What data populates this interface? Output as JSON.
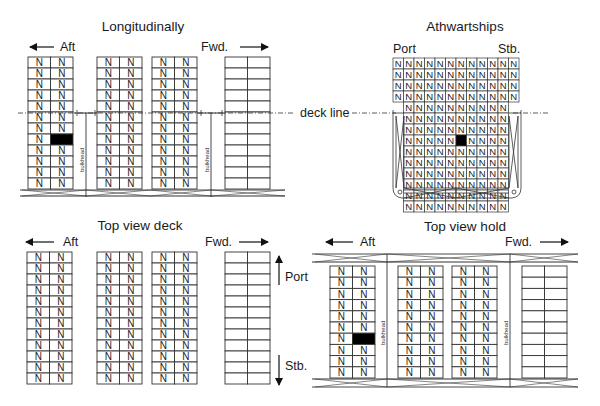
{
  "panels": {
    "longitudinal": {
      "title": "Longitudinally",
      "aft_label": "Aft",
      "fwd_label": "Fwd.",
      "deck_line_label": "deck line",
      "bulkhead_label": "bulkhead",
      "stacks": [
        {
          "rows": 12,
          "cols": 2,
          "marked": "N",
          "highlight": {
            "row": 7,
            "col": 1
          }
        },
        {
          "rows": 12,
          "cols": 2,
          "marked": "N"
        },
        {
          "rows": 12,
          "cols": 2,
          "marked": "N"
        },
        {
          "rows": 12,
          "cols": 2,
          "marked": ""
        }
      ]
    },
    "athwartships": {
      "title": "Athwartships",
      "port_label": "Port",
      "stb_label": "Stb.",
      "deck_rows": 4,
      "deck_cols": 12,
      "hold_rows": 10,
      "hold_cols": 10,
      "cell_label": "N",
      "highlight": {
        "row": 3,
        "col": 5
      }
    },
    "top_view_deck": {
      "title": "Top view deck",
      "aft_label": "Aft",
      "fwd_label": "Fwd.",
      "port_label": "Port",
      "stb_label": "Stb.",
      "stacks": [
        {
          "rows": 12,
          "cols": 2,
          "marked": "N"
        },
        {
          "rows": 12,
          "cols": 2,
          "marked": "N"
        },
        {
          "rows": 12,
          "cols": 2,
          "marked": "N"
        },
        {
          "rows": 12,
          "cols": 2,
          "marked": ""
        }
      ]
    },
    "top_view_hold": {
      "title": "Top view hold",
      "aft_label": "Aft",
      "fwd_label": "Fwd.",
      "bulkhead_label": "bulkhead",
      "stacks": [
        {
          "rows": 10,
          "cols": 2,
          "marked": "N",
          "highlight": {
            "row": 6,
            "col": 1
          }
        },
        {
          "rows": 10,
          "cols": 2,
          "marked": "N"
        },
        {
          "rows": 10,
          "cols": 2,
          "marked": "N"
        },
        {
          "rows": 10,
          "cols": 2,
          "marked": ""
        }
      ]
    }
  },
  "colors": {
    "line": "#333333",
    "highlight": "#000000",
    "background": "#ffffff"
  }
}
